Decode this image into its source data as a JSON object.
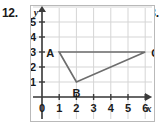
{
  "problems": {
    "left_label": "12.",
    "right_label": "13."
  },
  "chart_data": {
    "type": "scatter",
    "title": "",
    "xlabel": "x",
    "ylabel": "y",
    "xlim": [
      0,
      6.5
    ],
    "ylim": [
      0,
      5.6
    ],
    "grid": true,
    "legend": "none",
    "x_ticks": [
      "0",
      "1",
      "2",
      "3",
      "4",
      "5",
      "6"
    ],
    "x_tick_values": [
      0,
      1,
      2,
      3,
      4,
      5,
      6
    ],
    "y_ticks": [
      "1",
      "2",
      "3",
      "4",
      "5"
    ],
    "y_tick_values": [
      1,
      2,
      3,
      4,
      5
    ],
    "origin_label": "0",
    "shapes": [
      {
        "name": "triangle-abc",
        "closed": true,
        "vertices": [
          {
            "label": "A",
            "x": 1,
            "y": 3
          },
          {
            "label": "B",
            "x": 2,
            "y": 1
          },
          {
            "label": "C",
            "x": 6,
            "y": 3
          }
        ]
      }
    ],
    "colors": {
      "grid": "#d5d5d5",
      "axis": "#3b3b3b",
      "shape_stroke": "#6d6d6d",
      "text": "#1a1a1a"
    }
  }
}
